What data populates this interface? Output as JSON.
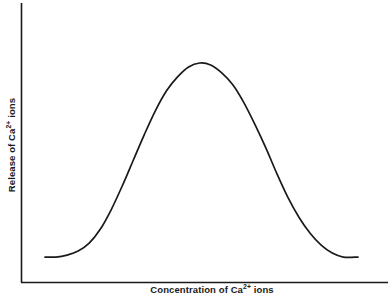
{
  "chart_data": {
    "type": "line",
    "title": "",
    "xlabel": "Concentration of Ca2+ ions",
    "ylabel": "Release of Ca2+ ions",
    "xlabel_base": "Concentration of Ca",
    "xlabel_sup": "2+",
    "xlabel_tail": " ions",
    "ylabel_base": "Release of Ca",
    "ylabel_sup": "2+",
    "ylabel_tail": " ions",
    "grid": false,
    "legend": "none",
    "xticks": [],
    "yticks": [],
    "xlim": [
      0,
      1
    ],
    "ylim": [
      0,
      1
    ],
    "series": [
      {
        "name": "Release of Ca2+ ions vs Concentration of Ca2+ ions",
        "shape": "bell",
        "color": "#1a1a1a",
        "x": [
          0.07,
          0.1,
          0.13,
          0.16,
          0.19,
          0.22,
          0.25,
          0.28,
          0.31,
          0.34,
          0.37,
          0.4,
          0.43,
          0.46,
          0.49,
          0.52,
          0.55,
          0.58,
          0.61,
          0.64,
          0.67,
          0.7,
          0.73,
          0.76,
          0.79,
          0.82,
          0.85,
          0.88,
          0.92
        ],
        "y": [
          0.02,
          0.02,
          0.03,
          0.05,
          0.09,
          0.16,
          0.26,
          0.38,
          0.51,
          0.64,
          0.76,
          0.86,
          0.93,
          0.98,
          1.0,
          0.99,
          0.95,
          0.89,
          0.8,
          0.69,
          0.57,
          0.44,
          0.32,
          0.22,
          0.14,
          0.08,
          0.04,
          0.02,
          0.02
        ]
      }
    ],
    "annotations": []
  },
  "axes": {
    "y_axis_name": "y-axis-line",
    "x_axis_name": "x-axis-line",
    "axis_color": "#1a1a1a"
  }
}
